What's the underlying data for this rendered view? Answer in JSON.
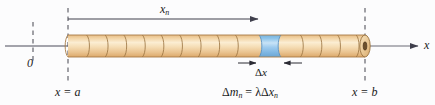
{
  "figure": {
    "name": "rod-mass-element-diagram",
    "background_color": "#fcfcfd",
    "labels": {
      "segment_length": {
        "base": "x",
        "sub": "n"
      },
      "origin": "0",
      "left_bound": "x = a",
      "right_bound": "x = b",
      "slice_width": {
        "delta": "Δ",
        "base": "x"
      },
      "mass_equation": "Δmₙ = λΔxₙ",
      "mass_equation_parts": {
        "delta_m": "Δm",
        "sub_n_1": "n",
        "equals": "=",
        "lambda": "λ",
        "delta_x": "Δx",
        "sub_n_2": "n"
      },
      "axis": "x"
    },
    "colors": {
      "rod_fill": "#f4d6a6",
      "rod_highlight": "#fbeccd",
      "rod_shadow": "#e0b878",
      "rod_outline": "#9a7340",
      "slice_fill": "#8cc4ea",
      "slice_highlight": "#c3e0f5",
      "slice_outline": "#5a93c4",
      "line_color": "#4b4b5a",
      "dash_color": "#55555f",
      "text_color": "#1a1a1a"
    },
    "geometry": {
      "rod_left": 68,
      "rod_right": 365,
      "rod_center_y": 46,
      "rod_half_height": 11,
      "segment_count": 16,
      "highlighted_segment_index": 11,
      "origin_x": 33,
      "axis_arrow_x": 420,
      "measure_arrow_y": 19,
      "measure_arrow_end": 262
    }
  }
}
